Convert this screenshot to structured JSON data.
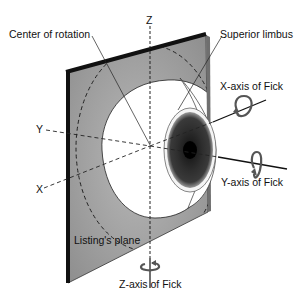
{
  "figure": {
    "labels": {
      "center_of_rotation": "Center of rotation",
      "superior_limbus": "Superior limbus",
      "x_axis_fick": "X-axis of Fick",
      "y_axis_fick": "Y-axis of Fick",
      "z_axis_fick": "Z-axis of Fick",
      "listings_plane": "Listing's plane",
      "z": "Z",
      "y": "Y",
      "x": "X"
    },
    "colors": {
      "plane_fill": "#9a9a9a",
      "plane_edge": "#1a1a1a",
      "sclera": "#ffffff",
      "iris": "#2a2a2a",
      "pupil": "#000000",
      "line": "#111111",
      "arrow": "#555555"
    }
  }
}
